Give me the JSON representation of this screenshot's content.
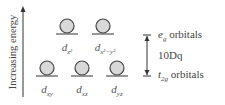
{
  "axis": {
    "label": "Increasing energy"
  },
  "eg_orbitals": [
    {
      "label_main": "d",
      "label_sub": "z²",
      "x": 67
    },
    {
      "label_main": "d",
      "label_sub": "x²−y²",
      "x": 103
    }
  ],
  "t2g_orbitals": [
    {
      "label_main": "d",
      "label_sub": "xy",
      "x": 47
    },
    {
      "label_main": "d",
      "label_sub": "xz",
      "x": 82
    },
    {
      "label_main": "d",
      "label_sub": "yz",
      "x": 117
    }
  ],
  "splitting": {
    "upper_label_sym": "e",
    "upper_label_sub": "g",
    "upper_label_text": " orbitals",
    "gap_label": "10Dq",
    "lower_label_sym": "t",
    "lower_label_sub": "2g",
    "lower_label_text": " orbitals"
  },
  "colors": {
    "circle_fill": "#d8d8d8",
    "stroke": "#333333"
  }
}
